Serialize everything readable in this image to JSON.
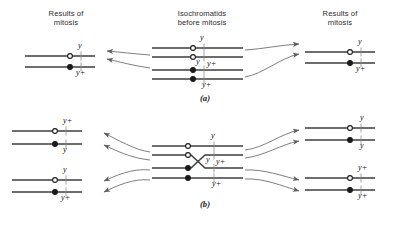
{
  "figure": {
    "title_left": "Results of\nmitosis",
    "headers": {
      "left": "Results of mitosis",
      "left_l1": "Results of",
      "left_l2": "mitosis",
      "center_l1": "Isochromatids",
      "center_l2": "before mitosis",
      "right_l1": "Results of",
      "right_l2": "mitosis"
    },
    "colors": {
      "background": "#ffffff",
      "line": "#3d3d3d",
      "arrow": "#6b6b6b",
      "text": "#1a1a1a",
      "centromere_open_fill": "#ffffff",
      "centromere_closed_fill": "#1a1a1a"
    }
  },
  "panels": [
    {
      "id": "a",
      "label": "(a)",
      "center": {
        "caption_l1": "Isochromatids",
        "caption_l2": "before mitosis",
        "chromatids": [
          {
            "index": 0,
            "centromere": "open",
            "allele": "y",
            "label_pos": "above"
          },
          {
            "index": 1,
            "centromere": "open",
            "allele": "y",
            "label_pos": "below"
          },
          {
            "index": 2,
            "centromere": "closed",
            "allele": "y+",
            "label_pos": "above"
          },
          {
            "index": 3,
            "centromere": "closed",
            "allele": "y+",
            "label_pos": "below"
          }
        ],
        "crossover": false
      },
      "results_left": {
        "caption_l1": "Results of",
        "caption_l2": "mitosis",
        "chromatids": [
          {
            "index": 0,
            "centromere": "open",
            "allele": "y",
            "label_pos": "above"
          },
          {
            "index": 1,
            "centromere": "closed",
            "allele": "y+",
            "label_pos": "below"
          }
        ]
      },
      "results_right": {
        "caption_l1": "Results of",
        "caption_l2": "mitosis",
        "chromatids": [
          {
            "index": 0,
            "centromere": "open",
            "allele": "y",
            "label_pos": "above"
          },
          {
            "index": 1,
            "centromere": "closed",
            "allele": "y+",
            "label_pos": "below"
          }
        ]
      },
      "arrows_left": 2,
      "arrows_right": 2
    },
    {
      "id": "b",
      "label": "(b)",
      "center": {
        "chromatids": [
          {
            "index": 0,
            "centromere": "open",
            "allele": "y",
            "label_pos": "above"
          },
          {
            "index": 1,
            "centromere": "open",
            "allele": "y",
            "label_pos": "below"
          },
          {
            "index": 2,
            "centromere": "closed",
            "allele": "y+",
            "label_pos": "above"
          },
          {
            "index": 3,
            "centromere": "closed",
            "allele": "y+",
            "label_pos": "below"
          }
        ],
        "crossover": true
      },
      "results_left": {
        "chromatids": [
          {
            "index": 0,
            "centromere": "open",
            "allele": "y+",
            "label_pos": "above"
          },
          {
            "index": 1,
            "centromere": "closed",
            "allele": "y",
            "label_pos": "below"
          },
          {
            "index": 2,
            "centromere": "open",
            "allele": "y",
            "label_pos": "above"
          },
          {
            "index": 3,
            "centromere": "closed",
            "allele": "y+",
            "label_pos": "below"
          }
        ]
      },
      "results_right": {
        "chromatids": [
          {
            "index": 0,
            "centromere": "open",
            "allele": "y",
            "label_pos": "above"
          },
          {
            "index": 1,
            "centromere": "closed",
            "allele": "y",
            "label_pos": "below"
          },
          {
            "index": 2,
            "centromere": "open",
            "allele": "y+",
            "label_pos": "above"
          },
          {
            "index": 3,
            "centromere": "closed",
            "allele": "y+",
            "label_pos": "below"
          }
        ]
      },
      "arrows_left": 4,
      "arrows_right": 4
    }
  ],
  "labels": {
    "y": "y",
    "yplus": "y+"
  }
}
